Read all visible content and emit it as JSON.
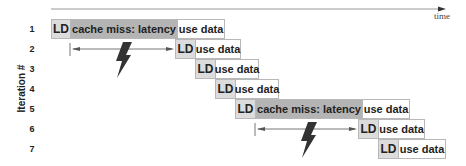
{
  "axis": {
    "x_label": "time",
    "y_label": "Iteration #"
  },
  "row_labels": [
    "1",
    "2",
    "3",
    "4",
    "5",
    "6",
    "7"
  ],
  "labels": {
    "ld": "LD",
    "latency": "cache miss: latency",
    "use": "use data"
  },
  "rows": [
    {
      "iteration": 1,
      "segments": [
        "LD",
        "cache miss: latency",
        "use data"
      ]
    },
    {
      "iteration": 2,
      "segments": [
        "LD",
        "use data"
      ]
    },
    {
      "iteration": 3,
      "segments": [
        "LD",
        "use data"
      ]
    },
    {
      "iteration": 4,
      "segments": [
        "LD",
        "use data"
      ]
    },
    {
      "iteration": 5,
      "segments": [
        "LD",
        "cache miss: latency",
        "use data"
      ]
    },
    {
      "iteration": 6,
      "segments": [
        "LD",
        "use data"
      ]
    },
    {
      "iteration": 7,
      "segments": [
        "LD",
        "use data"
      ]
    }
  ],
  "colors": {
    "ld": "#dcdcdc",
    "latency": "#b4b4b4",
    "use": "#ffffff",
    "border": "#b8b8b8"
  }
}
